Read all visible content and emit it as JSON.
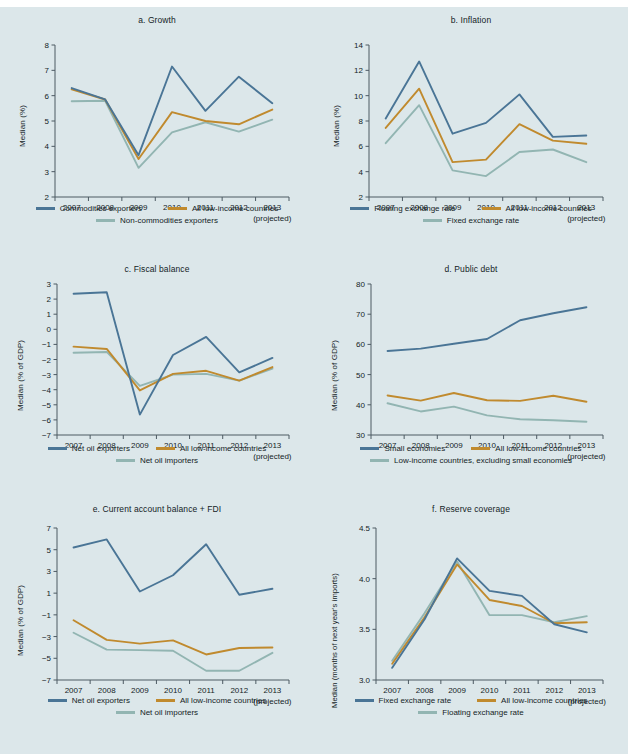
{
  "figure": {
    "background": "#dce7ea",
    "colors": {
      "blue": "#4a7596",
      "gold": "#c08a2e",
      "teal": "#92b5b2",
      "axis": "#4d5a63",
      "text": "#141d26"
    },
    "projected_note": "(projected)",
    "years": [
      "2007",
      "2008",
      "2009",
      "2010",
      "2011",
      "2012",
      "2013"
    ]
  },
  "chart_data": [
    {
      "id": "a",
      "type": "line",
      "title": "a. Growth",
      "ylabel": "Median (%)",
      "xlabel": "",
      "x": [
        "2007",
        "2008",
        "2009",
        "2010",
        "2011",
        "2012",
        "2013"
      ],
      "xtick_labels": [
        "2007",
        "2008",
        "2009",
        "2010",
        "2011",
        "2012",
        "2013"
      ],
      "ytick_labels": [
        "2",
        "3",
        "4",
        "5",
        "6",
        "7",
        "8"
      ],
      "yticks": [
        2,
        3,
        4,
        5,
        6,
        7,
        8
      ],
      "ylim": [
        2,
        8
      ],
      "grid": false,
      "legend_position": "below",
      "series": [
        {
          "name": "Commodities exporters",
          "color": "#4a7596",
          "values": [
            6.3,
            5.85,
            3.65,
            7.15,
            5.4,
            6.75,
            5.7
          ]
        },
        {
          "name": "All low-income countries",
          "color": "#c08a2e",
          "values": [
            6.25,
            5.85,
            3.5,
            5.35,
            5.0,
            4.87,
            5.45
          ]
        },
        {
          "name": "Non-commodities exporters",
          "color": "#92b5b2",
          "values": [
            5.78,
            5.8,
            3.15,
            4.55,
            4.95,
            4.58,
            5.05
          ]
        }
      ]
    },
    {
      "id": "b",
      "type": "line",
      "title": "b. Inflation",
      "ylabel": "Median (%)",
      "xlabel": "",
      "x": [
        "2007",
        "2008",
        "2009",
        "2010",
        "2011",
        "2012",
        "2013"
      ],
      "xtick_labels": [
        "2007",
        "2008",
        "2009",
        "2010",
        "2011",
        "2012",
        "2013"
      ],
      "ytick_labels": [
        "2",
        "4",
        "6",
        "8",
        "10",
        "12",
        "14"
      ],
      "yticks": [
        2,
        4,
        6,
        8,
        10,
        12,
        14
      ],
      "ylim": [
        2,
        14
      ],
      "grid": false,
      "legend_position": "below",
      "series": [
        {
          "name": "Floating exchange rate",
          "color": "#4a7596",
          "values": [
            8.2,
            12.7,
            7.0,
            7.85,
            10.1,
            6.75,
            6.85
          ]
        },
        {
          "name": "All low-income countries",
          "color": "#c08a2e",
          "values": [
            7.45,
            10.55,
            4.75,
            4.95,
            7.75,
            6.45,
            6.2
          ]
        },
        {
          "name": "Fixed exchange rate",
          "color": "#92b5b2",
          "values": [
            6.25,
            9.25,
            4.1,
            3.65,
            5.55,
            5.75,
            4.75
          ]
        }
      ]
    },
    {
      "id": "c",
      "type": "line",
      "title": "c. Fiscal balance",
      "ylabel": "Median (% of GDP)",
      "xlabel": "",
      "x": [
        "2007",
        "2008",
        "2009",
        "2010",
        "2011",
        "2012",
        "2013"
      ],
      "xtick_labels": [
        "2007",
        "2008",
        "2009",
        "2010",
        "2011",
        "2012",
        "2013"
      ],
      "ytick_labels": [
        "−7",
        "−6",
        "−5",
        "−4",
        "−3",
        "−2",
        "−1",
        "0",
        "1",
        "2",
        "3"
      ],
      "yticks": [
        -7,
        -6,
        -5,
        -4,
        -3,
        -2,
        -1,
        0,
        1,
        2,
        3
      ],
      "ylim": [
        -7,
        3
      ],
      "grid": false,
      "legend_position": "below",
      "series": [
        {
          "name": "Net oil exporters",
          "color": "#4a7596",
          "values": [
            2.35,
            2.45,
            -5.65,
            -1.7,
            -0.5,
            -2.85,
            -1.9
          ]
        },
        {
          "name": "All low-income countries",
          "color": "#c08a2e",
          "values": [
            -1.15,
            -1.3,
            -4.05,
            -2.95,
            -2.75,
            -3.4,
            -2.5
          ]
        },
        {
          "name": "Net oil importers",
          "color": "#92b5b2",
          "values": [
            -1.55,
            -1.5,
            -3.75,
            -3.0,
            -2.95,
            -3.4,
            -2.6
          ]
        }
      ]
    },
    {
      "id": "d",
      "type": "line",
      "title": "d. Public debt",
      "ylabel": "Median (% of GDP)",
      "xlabel": "",
      "x": [
        "2007",
        "2008",
        "2009",
        "2010",
        "2011",
        "2012",
        "2013"
      ],
      "xtick_labels": [
        "2007",
        "2008",
        "2009",
        "2010",
        "2011",
        "2012",
        "2013"
      ],
      "ytick_labels": [
        "30",
        "40",
        "50",
        "60",
        "70",
        "80"
      ],
      "yticks": [
        30,
        40,
        50,
        60,
        70,
        80
      ],
      "ylim": [
        30,
        80
      ],
      "grid": false,
      "legend_position": "below",
      "series": [
        {
          "name": "Small economies",
          "color": "#4a7596",
          "values": [
            57.8,
            58.6,
            60.2,
            61.8,
            68.0,
            70.3,
            72.3
          ]
        },
        {
          "name": "All low-income countries",
          "color": "#c08a2e",
          "values": [
            43.1,
            41.4,
            43.9,
            41.5,
            41.3,
            43.0,
            41.0
          ]
        },
        {
          "name": "Low-income countries, excluding small economies",
          "color": "#92b5b2",
          "values": [
            40.5,
            37.8,
            39.4,
            36.5,
            35.2,
            34.9,
            34.4
          ]
        }
      ]
    },
    {
      "id": "e",
      "type": "line",
      "title": "e. Current account balance + FDI",
      "ylabel": "Median (% of GDP)",
      "xlabel": "",
      "x": [
        "2007",
        "2008",
        "2009",
        "2010",
        "2011",
        "2012",
        "2013"
      ],
      "xtick_labels": [
        "2007",
        "2008",
        "2009",
        "2010",
        "2011",
        "2012",
        "2013"
      ],
      "ytick_labels": [
        "−7",
        "−5",
        "−3",
        "−1",
        "1",
        "3",
        "5",
        "7"
      ],
      "yticks": [
        -7,
        -5,
        -3,
        -1,
        1,
        3,
        5,
        7
      ],
      "ylim": [
        -7,
        7
      ],
      "grid": false,
      "legend_position": "below",
      "series": [
        {
          "name": "Net oil exporters",
          "color": "#4a7596",
          "values": [
            5.2,
            5.95,
            1.15,
            2.65,
            5.5,
            0.85,
            1.4
          ]
        },
        {
          "name": "All low-income countries",
          "color": "#c08a2e",
          "values": [
            -1.5,
            -3.3,
            -3.65,
            -3.35,
            -4.65,
            -4.05,
            -4.0
          ]
        },
        {
          "name": "Net oil importers",
          "color": "#92b5b2",
          "values": [
            -2.65,
            -4.2,
            -4.25,
            -4.3,
            -6.15,
            -6.15,
            -4.5
          ]
        }
      ]
    },
    {
      "id": "f",
      "type": "line",
      "title": "f. Reserve coverage",
      "ylabel": "Median (months of next year's imports)",
      "xlabel": "",
      "x": [
        "2007",
        "2008",
        "2009",
        "2010",
        "2011",
        "2012",
        "2013"
      ],
      "xtick_labels": [
        "2007",
        "2008",
        "2009",
        "2010",
        "2011",
        "2012",
        "2013"
      ],
      "ytick_labels": [
        "3.0",
        "3.5",
        "4.0",
        "4.5"
      ],
      "yticks": [
        3.0,
        3.5,
        4.0,
        4.5
      ],
      "ylim": [
        3.0,
        4.5
      ],
      "grid": false,
      "legend_position": "below",
      "series": [
        {
          "name": "Fixed exchange rate",
          "color": "#4a7596",
          "values": [
            3.12,
            3.6,
            4.2,
            3.88,
            3.83,
            3.55,
            3.47
          ]
        },
        {
          "name": "All low-income countries",
          "color": "#c08a2e",
          "values": [
            3.16,
            3.62,
            4.14,
            3.79,
            3.73,
            3.56,
            3.57
          ]
        },
        {
          "name": "Floating exchange rate",
          "color": "#92b5b2",
          "values": [
            3.19,
            3.66,
            4.17,
            3.64,
            3.64,
            3.57,
            3.63
          ]
        }
      ]
    }
  ]
}
